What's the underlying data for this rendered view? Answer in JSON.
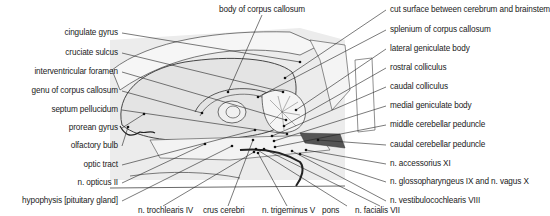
{
  "figure": {
    "colors": {
      "line": "#333333",
      "fill_light": "#e6e6e6",
      "fill_dark": "#555555",
      "background": "#ffffff"
    }
  },
  "labels": {
    "left": [
      {
        "text": "cingulate gyrus",
        "x": 118,
        "y": 28,
        "tx": 300,
        "ty": 62
      },
      {
        "text": "cruciate sulcus",
        "x": 118,
        "y": 48,
        "tx": 283,
        "ty": 92
      },
      {
        "text": "interventricular foramen",
        "x": 118,
        "y": 67,
        "tx": 286,
        "ty": 120
      },
      {
        "text": "genu of corpus callosum",
        "x": 118,
        "y": 86,
        "tx": 202,
        "ty": 113
      },
      {
        "text": "septum pellucidum",
        "x": 118,
        "y": 105,
        "tx": 287,
        "ty": 134
      },
      {
        "text": "prorean gyrus",
        "x": 118,
        "y": 123,
        "tx": 144,
        "ty": 114
      },
      {
        "text": "olfactory bulb",
        "x": 118,
        "y": 141,
        "tx": 128,
        "ty": 127
      },
      {
        "text": "optic tract",
        "x": 118,
        "y": 160,
        "tx": 255,
        "ty": 130
      },
      {
        "text": "n. opticus II",
        "x": 118,
        "y": 178,
        "tx": 205,
        "ty": 144
      },
      {
        "text": "hypophysis [pituitary gland]",
        "x": 118,
        "y": 196,
        "tx": 232,
        "ty": 146
      }
    ],
    "right": [
      {
        "text": "body of corpus callosum",
        "x": 262,
        "y": 5,
        "tx": 228,
        "ty": 92,
        "align": "center"
      },
      {
        "text": "cut surface between cerebrum and brainstem",
        "x": 390,
        "y": 5,
        "tx": 285,
        "ty": 78
      },
      {
        "text": "splenium of corpus callosum",
        "x": 390,
        "y": 25,
        "tx": 258,
        "ty": 97
      },
      {
        "text": "lateral geniculate body",
        "x": 390,
        "y": 44,
        "tx": 296,
        "ty": 110
      },
      {
        "text": "rostral colliculus",
        "x": 390,
        "y": 63,
        "tx": 284,
        "ty": 126
      },
      {
        "text": "caudal colliculus",
        "x": 390,
        "y": 82,
        "tx": 272,
        "ty": 136
      },
      {
        "text": "medial geniculate body",
        "x": 390,
        "y": 101,
        "tx": 274,
        "ty": 141
      },
      {
        "text": "middle cerebellar peduncle",
        "x": 390,
        "y": 120,
        "tx": 275,
        "ty": 147
      },
      {
        "text": "caudal cerebellar peduncle",
        "x": 390,
        "y": 140,
        "tx": 318,
        "ty": 140
      },
      {
        "text": "n. accessorius XI",
        "x": 390,
        "y": 159,
        "tx": 306,
        "ty": 150
      },
      {
        "text": "n. glossopharyngeus IX and n. vagus X",
        "x": 390,
        "y": 177,
        "tx": 300,
        "ty": 154
      },
      {
        "text": "n. vestibulocochlearis VIII",
        "x": 390,
        "y": 196,
        "tx": 292,
        "ty": 151
      }
    ],
    "bottom": [
      {
        "text": "n. trochlearis IV",
        "x": 138,
        "y": 206,
        "tx": 254,
        "ty": 152
      },
      {
        "text": "crus cerebri",
        "x": 203,
        "y": 206,
        "tx": 253,
        "ty": 140
      },
      {
        "text": "n. trigeminus V",
        "x": 262,
        "y": 206,
        "tx": 258,
        "ty": 153
      },
      {
        "text": "pons",
        "x": 322,
        "y": 206,
        "tx": 256,
        "ty": 149
      },
      {
        "text": "n. facialis VII",
        "x": 355,
        "y": 206,
        "tx": 264,
        "ty": 149
      }
    ]
  }
}
